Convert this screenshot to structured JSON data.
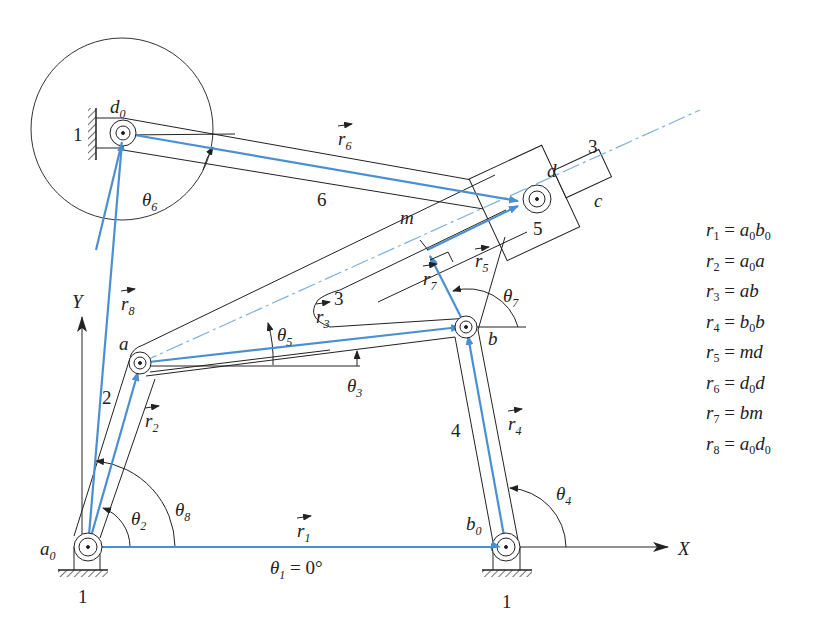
{
  "diagram": {
    "colors": {
      "link": "#2a2a2a",
      "vector": "#4a8fd1",
      "centerline": "#7fb0dd"
    },
    "points": {
      "a0": {
        "label": "a",
        "sub": "0"
      },
      "b0": {
        "label": "b",
        "sub": "0"
      },
      "a": {
        "label": "a"
      },
      "b": {
        "label": "b"
      },
      "d0": {
        "label": "d",
        "sub": "0"
      },
      "d": {
        "label": "d"
      },
      "m": {
        "label": "m"
      },
      "c": {
        "label": "c"
      }
    },
    "link_numbers": {
      "ground_a0": "1",
      "ground_b0": "1",
      "ground_d0": "1",
      "link2": "2",
      "link3_slot": "3",
      "link3_rod": "3",
      "link4": "4",
      "link5": "5",
      "link6": "6"
    },
    "vectors": {
      "r1": {
        "label": "r",
        "sub": "1"
      },
      "r2": {
        "label": "r",
        "sub": "2"
      },
      "r3": {
        "label": "r",
        "sub": "3"
      },
      "r4": {
        "label": "r",
        "sub": "4"
      },
      "r5": {
        "label": "r",
        "sub": "5"
      },
      "r6": {
        "label": "r",
        "sub": "6"
      },
      "r7": {
        "label": "r",
        "sub": "7"
      },
      "r8": {
        "label": "r",
        "sub": "8"
      }
    },
    "angles": {
      "theta1": {
        "label": "θ",
        "sub": "1",
        "value": " = 0°"
      },
      "theta2": {
        "label": "θ",
        "sub": "2"
      },
      "theta3": {
        "label": "θ",
        "sub": "3"
      },
      "theta4": {
        "label": "θ",
        "sub": "4"
      },
      "theta5": {
        "label": "θ",
        "sub": "5"
      },
      "theta6": {
        "label": "θ",
        "sub": "6"
      },
      "theta7": {
        "label": "θ",
        "sub": "7"
      },
      "theta8": {
        "label": "θ",
        "sub": "8"
      }
    },
    "axes": {
      "x": "X",
      "y": "Y"
    }
  },
  "legend": [
    {
      "lhs": "r",
      "lhs_sub": "1",
      "eq": " = ",
      "rhs": [
        [
          "a",
          "0"
        ],
        [
          "b",
          "0"
        ]
      ]
    },
    {
      "lhs": "r",
      "lhs_sub": "2",
      "eq": " = ",
      "rhs": [
        [
          "a",
          "0"
        ],
        [
          "a",
          ""
        ]
      ]
    },
    {
      "lhs": "r",
      "lhs_sub": "3",
      "eq": " = ",
      "rhs": [
        [
          "ab",
          ""
        ]
      ]
    },
    {
      "lhs": "r",
      "lhs_sub": "4",
      "eq": " = ",
      "rhs": [
        [
          "b",
          "0"
        ],
        [
          "b",
          ""
        ]
      ]
    },
    {
      "lhs": "r",
      "lhs_sub": "5",
      "eq": " = ",
      "rhs": [
        [
          "md",
          ""
        ]
      ]
    },
    {
      "lhs": "r",
      "lhs_sub": "6",
      "eq": " = ",
      "rhs": [
        [
          "d",
          "0"
        ],
        [
          "d",
          ""
        ]
      ]
    },
    {
      "lhs": "r",
      "lhs_sub": "7",
      "eq": " = ",
      "rhs": [
        [
          "bm",
          ""
        ]
      ]
    },
    {
      "lhs": "r",
      "lhs_sub": "8",
      "eq": " = ",
      "rhs": [
        [
          "a",
          "0"
        ],
        [
          "d",
          "0"
        ]
      ]
    }
  ]
}
